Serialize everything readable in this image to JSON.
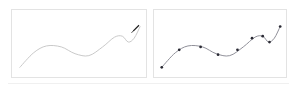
{
  "view": {
    "title": "Curve comparison panels",
    "background_color": "#ffffff",
    "width": 297,
    "height": 89
  },
  "rule": {
    "name": "baseline-rule",
    "color": "#f0f0f0"
  },
  "panels": [
    {
      "id": "left",
      "name": "smooth-curve-panel",
      "label": "Smooth curve without control points",
      "border_color": "#e3e3e3",
      "background_color": "#ffffff",
      "curve_color": "#c8c8c8",
      "curve_width": 1,
      "markers_visible": false,
      "marker_color": "#c8c8c8",
      "cursor": {
        "name": "pen-cursor",
        "icon": "pen-cursor-icon",
        "color": "#1a1a1a",
        "x": 131,
        "y": 19
      }
    },
    {
      "id": "right",
      "name": "control-point-curve-panel",
      "label": "Smooth curve with control points",
      "border_color": "#e3e3e3",
      "background_color": "#ffffff",
      "curve_color": "#8c8c96",
      "curve_width": 1,
      "markers_visible": true,
      "marker_color": "#2a2a34",
      "marker_radius": 1.4
    }
  ],
  "chart_data": {
    "type": "line",
    "title": "",
    "xlabel": "",
    "ylabel": "",
    "xlim": [
      0,
      136
    ],
    "ylim": [
      0,
      69
    ],
    "grid": false,
    "legend": null,
    "series": [
      {
        "name": "smooth-curve-left",
        "panel": "left",
        "stroke": "#c8c8c8",
        "markers": false,
        "points": [
          [
            8,
            59
          ],
          [
            22,
            44
          ],
          [
            35,
            37
          ],
          [
            50,
            38
          ],
          [
            64,
            45
          ],
          [
            78,
            47
          ],
          [
            92,
            38
          ],
          [
            104,
            28
          ],
          [
            112,
            27
          ],
          [
            118,
            33
          ],
          [
            124,
            29
          ],
          [
            130,
            17
          ]
        ]
      },
      {
        "name": "smooth-curve-right",
        "panel": "right",
        "stroke": "#8c8c96",
        "markers": true,
        "points": [
          [
            8,
            59
          ],
          [
            22,
            44
          ],
          [
            35,
            37
          ],
          [
            50,
            38
          ],
          [
            64,
            45
          ],
          [
            78,
            47
          ],
          [
            92,
            38
          ],
          [
            104,
            28
          ],
          [
            112,
            27
          ],
          [
            118,
            33
          ],
          [
            124,
            29
          ],
          [
            130,
            17
          ]
        ],
        "control_points": [
          [
            8,
            59
          ],
          [
            26,
            41
          ],
          [
            48,
            38
          ],
          [
            66,
            46
          ],
          [
            86,
            41
          ],
          [
            101,
            29
          ],
          [
            112,
            27
          ],
          [
            119,
            33
          ],
          [
            130,
            17
          ]
        ]
      }
    ]
  }
}
